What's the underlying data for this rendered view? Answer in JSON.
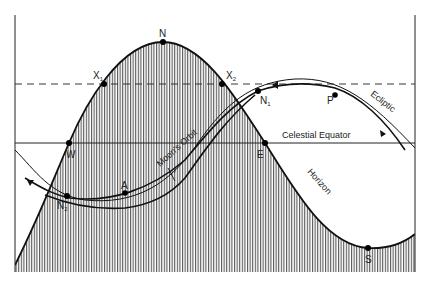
{
  "diagram": {
    "type": "celestial-sphere-projection",
    "colors": {
      "ink": "#1a1a1a",
      "background": "#ffffff",
      "hatch": "#333333"
    },
    "curves": {
      "horizon": "Horizon",
      "ecliptic": "Ecliptic",
      "moons_orbit": "Moon's Orbit",
      "celestial_equator": "Celestial Equator"
    },
    "points": {
      "N": "N",
      "X1": "X",
      "X1_sub": "1",
      "X2": "X",
      "X2_sub": "2",
      "W": "W",
      "E": "E",
      "S": "S",
      "N1": "N",
      "N1_sub": "1",
      "N2": "N",
      "N2_sub": "2",
      "A": "A",
      "P": "P"
    },
    "angle_label": "i"
  }
}
